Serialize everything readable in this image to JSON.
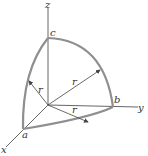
{
  "diagram": {
    "axes": {
      "x": {
        "label": "x"
      },
      "y": {
        "label": "y"
      },
      "z": {
        "label": "z"
      }
    },
    "points": [
      {
        "id": "a",
        "label": "a",
        "on_axis": "x"
      },
      {
        "id": "b",
        "label": "b",
        "on_axis": "y"
      },
      {
        "id": "c",
        "label": "c",
        "on_axis": "z"
      }
    ],
    "arcs": [
      {
        "from": "c",
        "to": "b"
      },
      {
        "from": "c",
        "to": "a"
      },
      {
        "from": "a",
        "to": "b"
      }
    ],
    "radii": [
      {
        "label": "r",
        "to_arc": "c-a"
      },
      {
        "label": "r",
        "to_arc": "c-b"
      },
      {
        "label": "r",
        "to_arc": "a-b"
      }
    ],
    "colors": {
      "arc": "#8f8f8f",
      "axis": "#555555",
      "text": "#333333"
    }
  }
}
